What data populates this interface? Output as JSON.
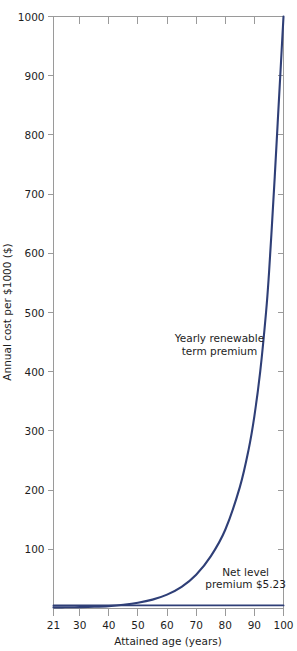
{
  "chart_data": {
    "type": "line",
    "title": "",
    "xlabel": "Attained age (years)",
    "ylabel": "Annual cost per $1000 ($)",
    "xlim": [
      21,
      100
    ],
    "ylim": [
      0,
      1000
    ],
    "grid": false,
    "legend": "none",
    "xticks": [
      21,
      30,
      40,
      50,
      60,
      70,
      80,
      90,
      100
    ],
    "xtick_labels": [
      "21",
      "30",
      "40",
      "50",
      "60",
      "70",
      "80",
      "90",
      "100"
    ],
    "yticks": [
      0,
      100,
      200,
      300,
      400,
      500,
      600,
      700,
      800,
      900,
      1000
    ],
    "ytick_labels": [
      "",
      "100",
      "200",
      "300",
      "400",
      "500",
      "600",
      "700",
      "800",
      "900",
      "1000"
    ],
    "series": [
      {
        "name": "Yearly renewable term premium",
        "color": "#2f3f77",
        "x": [
          21,
          25,
          30,
          35,
          40,
          45,
          50,
          55,
          60,
          65,
          70,
          75,
          80,
          85,
          88,
          90,
          92,
          94,
          95,
          96,
          97,
          98,
          99,
          100
        ],
        "values": [
          1.9,
          2.0,
          2.3,
          2.9,
          4.0,
          6.2,
          9.6,
          15.0,
          23.5,
          36.5,
          57.0,
          88.0,
          133.0,
          205.0,
          268.0,
          325.0,
          400.0,
          500.0,
          565.0,
          645.0,
          730.0,
          820.0,
          910.0,
          1000.0
        ]
      },
      {
        "name": "Net level premium",
        "color": "#2f3f77",
        "x": [
          21,
          100
        ],
        "values": [
          5.23,
          5.23
        ]
      }
    ],
    "annotations": [
      {
        "id": "yrt-label",
        "lines": [
          "Yearly renewable",
          "term premium"
        ],
        "x": 78,
        "y": 450
      },
      {
        "id": "net-level-label",
        "lines": [
          "Net level",
          "premium $5.23"
        ],
        "x": 87,
        "y": 55
      }
    ]
  }
}
